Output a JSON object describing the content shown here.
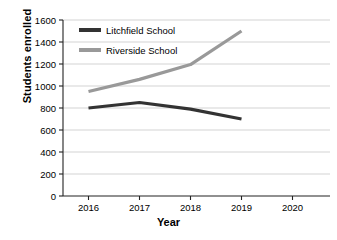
{
  "chart_data": {
    "type": "line",
    "title": "",
    "xlabel": "Year",
    "ylabel": "Students enrolled",
    "x": [
      2016,
      2017,
      2018,
      2019
    ],
    "xticks": [
      "2016",
      "2017",
      "2018",
      "2019",
      "2020"
    ],
    "yticks": [
      "0",
      "200",
      "400",
      "600",
      "800",
      "1000",
      "1200",
      "1400",
      "1600"
    ],
    "xlim": [
      2015.5,
      2020.5
    ],
    "ylim": [
      0,
      1600
    ],
    "grid": "horizontal",
    "legend_position": "top-left-inside",
    "series": [
      {
        "name": "Litchfield School",
        "color": "#333333",
        "values": [
          800,
          850,
          790,
          700
        ]
      },
      {
        "name": "Riverside School",
        "color": "#999999",
        "values": [
          950,
          1060,
          1195,
          1500
        ]
      }
    ]
  },
  "axes": {
    "y_title": "Students enrolled",
    "x_title": "Year"
  }
}
